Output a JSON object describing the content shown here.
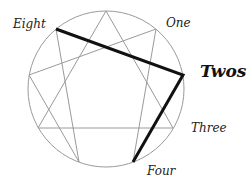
{
  "diagram": {
    "type": "enneagram",
    "title_label": "Twos",
    "highlighted_type": "Two",
    "point_labels": {
      "eight": "Eight",
      "one": "One",
      "three": "Three",
      "four": "Four"
    },
    "highlighted_connections": [
      {
        "from": "Eight",
        "to": "Two"
      },
      {
        "from": "Two",
        "to": "Four"
      }
    ],
    "colors": {
      "circle": "#9a9a9a",
      "inner_lines": "#9a9a9a",
      "highlight": "#111111",
      "text": "#222222"
    }
  }
}
